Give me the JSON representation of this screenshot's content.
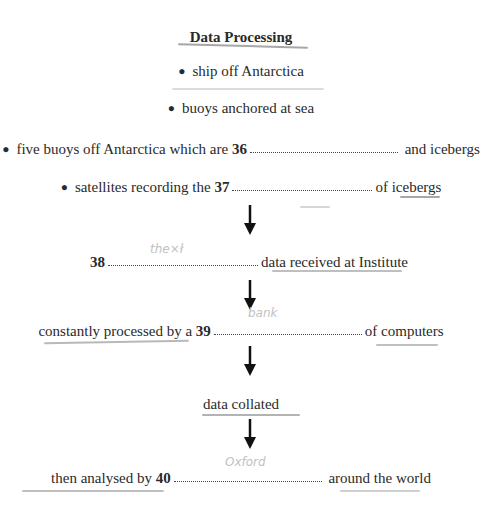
{
  "title": "Data Processing",
  "sources": [
    {
      "text": "ship off Antarctica"
    },
    {
      "text": "buoys anchored at sea"
    },
    {
      "before": "five buoys off Antarctica which are",
      "number": "36",
      "after": "and icebergs"
    },
    {
      "before": "satellites recording the",
      "number": "37",
      "after": "of icebergs"
    }
  ],
  "steps": [
    {
      "before": "",
      "number": "38",
      "after": "data received at Institute"
    },
    {
      "before": "constantly processed by a",
      "number": "39",
      "after": "of computers"
    },
    {
      "text": "data collated"
    },
    {
      "before": "then analysed by",
      "number": "40",
      "after": "around the world"
    }
  ],
  "arrow_glyph": "down-arrow"
}
